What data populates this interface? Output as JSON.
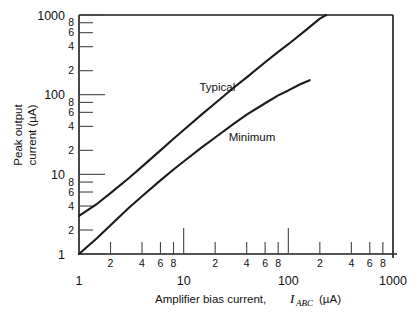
{
  "chart_data": {
    "type": "line",
    "title": "",
    "xlabel": "Amplifier bias current, I_ABC (µA)",
    "xlabel_prefix": "Amplifier bias current,",
    "xlabel_symbol": "I",
    "xlabel_subscript": "ABC",
    "xlabel_units": "(µA)",
    "ylabel": "Peak output current (µA)",
    "ylabel_line1": "Peak output",
    "ylabel_line2": "current (µA)",
    "xscale": "log",
    "yscale": "log",
    "xlim": [
      1,
      1000
    ],
    "ylim": [
      1,
      1000
    ],
    "grid": false,
    "legend": "inline-annotations",
    "x_decade_labels": [
      "1",
      "10",
      "100",
      "1000"
    ],
    "x_decade_values": [
      1,
      10,
      100,
      1000
    ],
    "x_minor_labels": [
      "2",
      "4",
      "6",
      "8"
    ],
    "x_minor_values": [
      2,
      4,
      6,
      8
    ],
    "y_decade_labels": [
      "1",
      "10",
      "100",
      "1000"
    ],
    "y_decade_values": [
      1,
      10,
      100,
      1000
    ],
    "y_minor_labels": [
      "2",
      "4",
      "6",
      "8"
    ],
    "y_minor_values": [
      2,
      4,
      6,
      8
    ],
    "series": [
      {
        "name": "Typical",
        "label": "Typical",
        "label_x": 21,
        "label_y": 110,
        "points": [
          [
            1,
            3.0
          ],
          [
            1.5,
            4.3
          ],
          [
            2,
            5.8
          ],
          [
            3,
            9.0
          ],
          [
            4,
            12.5
          ],
          [
            6,
            20.0
          ],
          [
            8,
            28.0
          ],
          [
            10,
            36.0
          ],
          [
            15,
            57.0
          ],
          [
            20,
            78.0
          ],
          [
            30,
            122.0
          ],
          [
            40,
            165.0
          ],
          [
            60,
            255.0
          ],
          [
            80,
            345.0
          ],
          [
            100,
            430.0
          ],
          [
            150,
            660.0
          ],
          [
            200,
            900.0
          ],
          [
            230,
            1000.0
          ]
        ]
      },
      {
        "name": "Minimum",
        "label": "Minimum",
        "label_x": 45,
        "label_y": 26,
        "points": [
          [
            1,
            1.0
          ],
          [
            1.5,
            1.6
          ],
          [
            2,
            2.3
          ],
          [
            3,
            3.8
          ],
          [
            4,
            5.3
          ],
          [
            6,
            8.4
          ],
          [
            8,
            11.5
          ],
          [
            10,
            14.5
          ],
          [
            15,
            22.0
          ],
          [
            20,
            29.0
          ],
          [
            30,
            43.0
          ],
          [
            40,
            56.0
          ],
          [
            60,
            78.0
          ],
          [
            80,
            98.0
          ],
          [
            100,
            113.0
          ],
          [
            130,
            135.0
          ],
          [
            160,
            152.0
          ]
        ]
      }
    ]
  }
}
